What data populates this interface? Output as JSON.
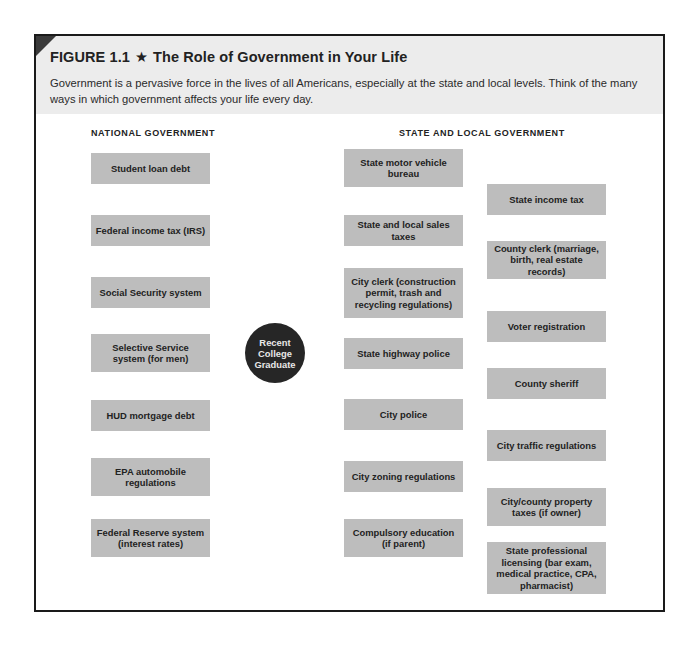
{
  "figure": {
    "label": "FIGURE 1.1",
    "star_icon": "★",
    "title": "The Role of Government in Your Life",
    "description": "Government is a pervasive force in the lives of all Americans, especially at the state and local levels. Think of the many ways in which government affects your life every day."
  },
  "columns": {
    "national_heading": "NATIONAL GOVERNMENT",
    "state_local_heading": "STATE AND LOCAL GOVERNMENT"
  },
  "hub": {
    "label": "Recent College Graduate"
  },
  "national": [
    {
      "label": "Student loan debt"
    },
    {
      "label": "Federal income tax (IRS)"
    },
    {
      "label": "Social Security system"
    },
    {
      "label": "Selective Service system (for men)"
    },
    {
      "label": "HUD mortgage debt"
    },
    {
      "label": "EPA automobile regulations"
    },
    {
      "label": "Federal Reserve system (interest rates)"
    }
  ],
  "state_local_inner": [
    {
      "label": "State motor vehicle bureau"
    },
    {
      "label": "State and local sales taxes"
    },
    {
      "label": "City clerk (construction permit, trash and recycling regulations)"
    },
    {
      "label": "State highway police"
    },
    {
      "label": "City police"
    },
    {
      "label": "City zoning regulations"
    },
    {
      "label": "Compulsory education (if parent)"
    }
  ],
  "state_local_outer": [
    {
      "label": "State income tax"
    },
    {
      "label": "County clerk (marriage, birth, real estate records)"
    },
    {
      "label": "Voter registration"
    },
    {
      "label": "County sheriff"
    },
    {
      "label": "City traffic regulations"
    },
    {
      "label": "City/county property taxes (if owner)"
    },
    {
      "label": "State professional licensing (bar exam, medical practice, CPA, pharmacist)"
    }
  ],
  "colors": {
    "box_fill": "#bdbdbd",
    "hub_fill": "#262626",
    "header_band": "#ececec",
    "line": "#3a3a3a"
  }
}
